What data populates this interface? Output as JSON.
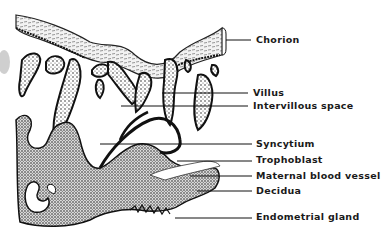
{
  "figure": {
    "labels": [
      {
        "id": "chorion",
        "text": "Chorion",
        "x": 256,
        "y": 35,
        "line_x1": 226,
        "line_y": 40
      },
      {
        "id": "villus",
        "text": "Villus",
        "x": 253,
        "y": 88,
        "line_x1": 162,
        "line_y": 93
      },
      {
        "id": "intervillous-space",
        "text": "Intervillous  space",
        "x": 253,
        "y": 101,
        "line_x1": 121,
        "line_y": 106
      },
      {
        "id": "syncytium",
        "text": "Syncytium",
        "x": 256,
        "y": 139,
        "line_x1": 100,
        "line_y": 144
      },
      {
        "id": "trophoblast",
        "text": "Trophoblast",
        "x": 256,
        "y": 155,
        "line_x1": 177,
        "line_y": 161
      },
      {
        "id": "maternal-blood-vessel",
        "text": "Maternal  blood  vessel",
        "x": 256,
        "y": 171,
        "line_x1": 190,
        "line_y": 176
      },
      {
        "id": "decidua",
        "text": "Decidua",
        "x": 256,
        "y": 186,
        "line_x1": 197,
        "line_y": 191
      },
      {
        "id": "endometrial-gland",
        "text": "Endometrial  gland",
        "x": 256,
        "y": 211,
        "line_x1": 175,
        "line_y": 218
      }
    ],
    "colors": {
      "ink": "#1a1a1a",
      "background": "#ffffff",
      "stipple": "#555555"
    }
  }
}
